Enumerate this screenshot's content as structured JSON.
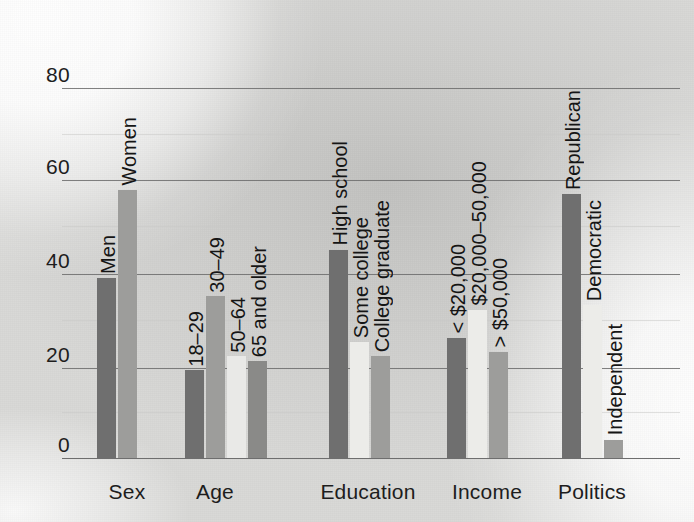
{
  "figure": {
    "title": "",
    "y_axis": {
      "ticks": [
        "0",
        "20",
        "40",
        "60",
        "80"
      ],
      "min": 0,
      "max": 80,
      "label": ""
    }
  },
  "chart_data": {
    "type": "bar",
    "title": "",
    "xlabel": "",
    "ylabel": "",
    "ylim": [
      0,
      80
    ],
    "ytick_values": [
      0,
      20,
      40,
      60,
      80
    ],
    "grid": true,
    "legend": "none",
    "groups": [
      {
        "name": "Sex",
        "bars": [
          {
            "label": "Men",
            "value": 39,
            "color": "#6f6f6f"
          },
          {
            "label": "Women",
            "value": 58,
            "color": "#9d9d9b"
          }
        ]
      },
      {
        "name": "Age",
        "bars": [
          {
            "label": "18–29",
            "value": 19,
            "color": "#6f6f6f"
          },
          {
            "label": "30–49",
            "value": 35,
            "color": "#9d9d9b"
          },
          {
            "label": "50–64",
            "value": 22,
            "color": "#e9e9e7"
          },
          {
            "label": "65 and older",
            "value": 21,
            "color": "#8a8a88"
          }
        ]
      },
      {
        "name": "Education",
        "bars": [
          {
            "label": "High school",
            "value": 45,
            "color": "#6f6f6f"
          },
          {
            "label": "Some college",
            "value": 25,
            "color": "#ecece9"
          },
          {
            "label": "College graduate",
            "value": 22,
            "color": "#9d9d9b"
          }
        ]
      },
      {
        "name": "Income",
        "bars": [
          {
            "label": "< $20,000",
            "value": 26,
            "color": "#6f6f6f"
          },
          {
            "label": "$20,000–50,000",
            "value": 32,
            "color": "#ecece9"
          },
          {
            "label": "> $50,000",
            "value": 23,
            "color": "#9d9d9b"
          }
        ]
      },
      {
        "name": "Politics",
        "bars": [
          {
            "label": "Republican",
            "value": 57,
            "color": "#6f6f6f"
          },
          {
            "label": "Democratic",
            "value": 33,
            "color": "#ecece9"
          },
          {
            "label": "Independent",
            "value": 4,
            "color": "#9d9d9b"
          }
        ]
      }
    ]
  },
  "layout": {
    "plot_left": 62,
    "plot_right": 680,
    "baseline_y": 458,
    "top_y": 88,
    "bar_width": 19,
    "bar_gap": 2,
    "group_starts": [
      97,
      185,
      329,
      447,
      562
    ],
    "group_label_centers": [
      127,
      215,
      368,
      487,
      592
    ],
    "gridline_y": {
      "0": 458,
      "20": 368,
      "40": 274,
      "60": 180,
      "80": 88
    },
    "faint_gridline_y": [
      134,
      226,
      320,
      412
    ]
  },
  "colors": {
    "paper": "#d9d9d7",
    "ink": "#171717",
    "gridline": "#6b6b6b",
    "bar_dark": "#6f6f6f",
    "bar_mid": "#9d9d9b",
    "bar_light": "#ecece9"
  }
}
